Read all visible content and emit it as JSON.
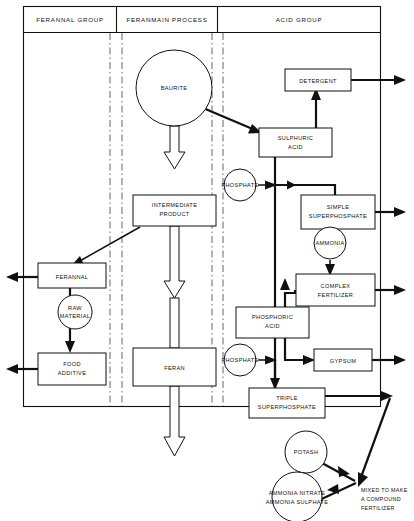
{
  "diagram": {
    "colors": {
      "line": "#111111",
      "divider": "#555555",
      "node_fill": "#ffffff",
      "background": "#ffffff"
    },
    "columns": [
      {
        "id": "col-ferannal",
        "label": "FERANNAL GROUP"
      },
      {
        "id": "col-feranmain",
        "label": "FERANMAIN PROCESS"
      },
      {
        "id": "col-acid",
        "label": "ACID GROUP"
      }
    ],
    "nodes": {
      "baurite": {
        "label": "BAURITE",
        "shape": "circle"
      },
      "intermediate_product": {
        "label_line1": "INTERMEDIATE",
        "label_line2": "PRODUCT",
        "shape": "rect"
      },
      "feran": {
        "label": "FERAN",
        "shape": "rect"
      },
      "ferannal": {
        "label": "FERANNAL",
        "shape": "rect"
      },
      "raw_material": {
        "label_line1": "RAW",
        "label_line2": "MATERIAL",
        "shape": "circle"
      },
      "food_additive": {
        "label_line1": "FOOD",
        "label_line2": "ADDITIVE",
        "shape": "rect"
      },
      "detergent": {
        "label": "DETERGENT",
        "shape": "rect"
      },
      "sulphuric_acid": {
        "label_line1": "SULPHURIC",
        "label_line2": "ACID",
        "shape": "rect"
      },
      "phosphate_upper": {
        "label": "PHOSPHATE",
        "shape": "circle"
      },
      "simple_superphosphate": {
        "label_line1": "SIMPLE",
        "label_line2": "SUPERPHOSPHATE",
        "shape": "rect"
      },
      "ammonia": {
        "label": "AMMONIA",
        "shape": "circle"
      },
      "complex_fertilizer": {
        "label_line1": "COMPLEX",
        "label_line2": "FERTILIZER",
        "shape": "rect"
      },
      "phosphoric_acid": {
        "label_line1": "PHOSPHORIC",
        "label_line2": "ACID",
        "shape": "rect"
      },
      "phosphate_lower": {
        "label": "PHOSPHATE",
        "shape": "circle"
      },
      "gypsum": {
        "label": "GYPSUM",
        "shape": "rect"
      },
      "triple_superphosphate": {
        "label_line1": "TRIPLE",
        "label_line2": "SUPERPHOSPHATE",
        "shape": "rect"
      },
      "potash": {
        "label": "POTASH",
        "shape": "circle"
      },
      "ammonia_salts": {
        "label_line1": "AMMONIA NITRATE",
        "label_line2": "AMMONIA SULPHATE",
        "shape": "circle"
      },
      "compound_note": {
        "label_line1": "MIXED TO MAKE",
        "label_line2": "A COMPOUND",
        "label_line3": "FERTILIZER",
        "shape": "text"
      }
    },
    "edges": [
      {
        "from": "baurite",
        "to": "intermediate_product",
        "style": "hollow"
      },
      {
        "from": "baurite",
        "to": "sulphuric_acid",
        "style": "solid"
      },
      {
        "from": "intermediate_product",
        "to": "feran",
        "style": "hollow"
      },
      {
        "from": "intermediate_product",
        "to": "ferannal",
        "style": "solid"
      },
      {
        "from": "feran",
        "to": "output-bottom",
        "style": "hollow"
      },
      {
        "from": "ferannal",
        "to": "output-left",
        "style": "solid"
      },
      {
        "from": "ferannal",
        "to": "food_additive",
        "style": "solid"
      },
      {
        "from": "raw_material",
        "to": "ferannal-feed",
        "style": "solid"
      },
      {
        "from": "food_additive",
        "to": "output-left",
        "style": "solid"
      },
      {
        "from": "sulphuric_acid",
        "to": "detergent",
        "style": "solid"
      },
      {
        "from": "detergent",
        "to": "output-right",
        "style": "solid"
      },
      {
        "from": "sulphuric_acid",
        "to": "simple_superphosphate",
        "style": "solid"
      },
      {
        "from": "phosphate_upper",
        "to": "sulphuric-line",
        "style": "solid"
      },
      {
        "from": "simple_superphosphate",
        "to": "output-right",
        "style": "solid"
      },
      {
        "from": "ammonia",
        "to": "complex_fertilizer",
        "style": "solid"
      },
      {
        "from": "complex_fertilizer",
        "to": "output-right",
        "style": "solid"
      },
      {
        "from": "phosphoric_acid",
        "to": "complex_fertilizer",
        "style": "solid"
      },
      {
        "from": "phosphoric_acid",
        "to": "gypsum",
        "style": "solid"
      },
      {
        "from": "phosphate_lower",
        "to": "phosphoric-line",
        "style": "solid"
      },
      {
        "from": "gypsum",
        "to": "output-right",
        "style": "solid"
      },
      {
        "from": "phosphoric_acid",
        "to": "triple_superphosphate",
        "style": "solid"
      },
      {
        "from": "triple_superphosphate",
        "to": "compound_note",
        "style": "solid"
      },
      {
        "from": "potash",
        "to": "compound_note",
        "style": "solid"
      },
      {
        "from": "ammonia_salts",
        "to": "compound_note",
        "style": "solid"
      }
    ]
  }
}
